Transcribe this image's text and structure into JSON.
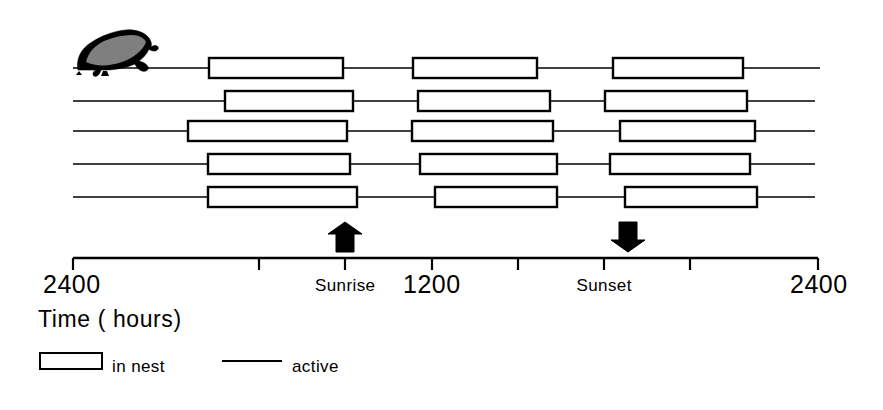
{
  "figure": {
    "title_visible": false,
    "animal_icon": "rodent-silhouette-icon"
  },
  "axis": {
    "caption": "Time ( hours)",
    "ticks": [
      {
        "label": "2400",
        "type": "number",
        "x": 73
      },
      {
        "label": "",
        "type": "plain",
        "x": 259
      },
      {
        "label": "Sunrise",
        "type": "word",
        "x": 345
      },
      {
        "label": "1200",
        "type": "number",
        "x": 432
      },
      {
        "label": "",
        "type": "plain",
        "x": 518
      },
      {
        "label": "Sunset",
        "type": "word",
        "x": 604
      },
      {
        "label": "",
        "type": "plain",
        "x": 690
      },
      {
        "label": "2400",
        "type": "number",
        "x": 818
      }
    ],
    "markers": [
      {
        "name": "sunrise-arrow",
        "direction": "up",
        "x": 345
      },
      {
        "name": "sunset-arrow",
        "direction": "down",
        "x": 628
      }
    ]
  },
  "legend": {
    "items": [
      {
        "symbol": "box",
        "label": "in nest"
      },
      {
        "symbol": "line",
        "label": "active"
      }
    ]
  },
  "colors": {
    "ink": "#000000",
    "background": "#ffffff",
    "box_fill": "#ffffff"
  },
  "chart_data": {
    "type": "bar",
    "xlabel": "Time ( hours)",
    "ylabel": "",
    "xlim": [
      73,
      818
    ],
    "x_axis_kind": "time-of-day",
    "x_tick_labels": [
      "2400",
      "",
      "Sunrise",
      "1200",
      "",
      "Sunset",
      "",
      "2400"
    ],
    "x_tick_positions": [
      73,
      259,
      345,
      432,
      518,
      604,
      690,
      818
    ],
    "grid": false,
    "legend": [
      "in nest",
      "active"
    ],
    "legend_position": "below-axis-left",
    "annotations": [
      {
        "text": "Sunrise",
        "marker": "up-arrow",
        "x": 345
      },
      {
        "text": "Sunset",
        "marker": "down-arrow",
        "x": 628
      }
    ],
    "series": [
      {
        "name": "row-1",
        "y": 68,
        "line_start": 73,
        "line_end": 820,
        "in_nest_bouts": [
          {
            "start": 209,
            "end": 343
          },
          {
            "start": 413,
            "end": 537
          },
          {
            "start": 613,
            "end": 743
          }
        ]
      },
      {
        "name": "row-2",
        "y": 101,
        "line_start": 73,
        "line_end": 815,
        "in_nest_bouts": [
          {
            "start": 225,
            "end": 353
          },
          {
            "start": 418,
            "end": 550
          },
          {
            "start": 605,
            "end": 747
          }
        ]
      },
      {
        "name": "row-3",
        "y": 131,
        "line_start": 73,
        "line_end": 815,
        "in_nest_bouts": [
          {
            "start": 188,
            "end": 347
          },
          {
            "start": 412,
            "end": 553
          },
          {
            "start": 620,
            "end": 755
          }
        ]
      },
      {
        "name": "row-4",
        "y": 164,
        "line_start": 73,
        "line_end": 815,
        "in_nest_bouts": [
          {
            "start": 208,
            "end": 350
          },
          {
            "start": 420,
            "end": 557
          },
          {
            "start": 610,
            "end": 750
          }
        ]
      },
      {
        "name": "row-5",
        "y": 197,
        "line_start": 73,
        "line_end": 815,
        "in_nest_bouts": [
          {
            "start": 208,
            "end": 357
          },
          {
            "start": 435,
            "end": 557
          },
          {
            "start": 625,
            "end": 757
          }
        ]
      }
    ]
  }
}
